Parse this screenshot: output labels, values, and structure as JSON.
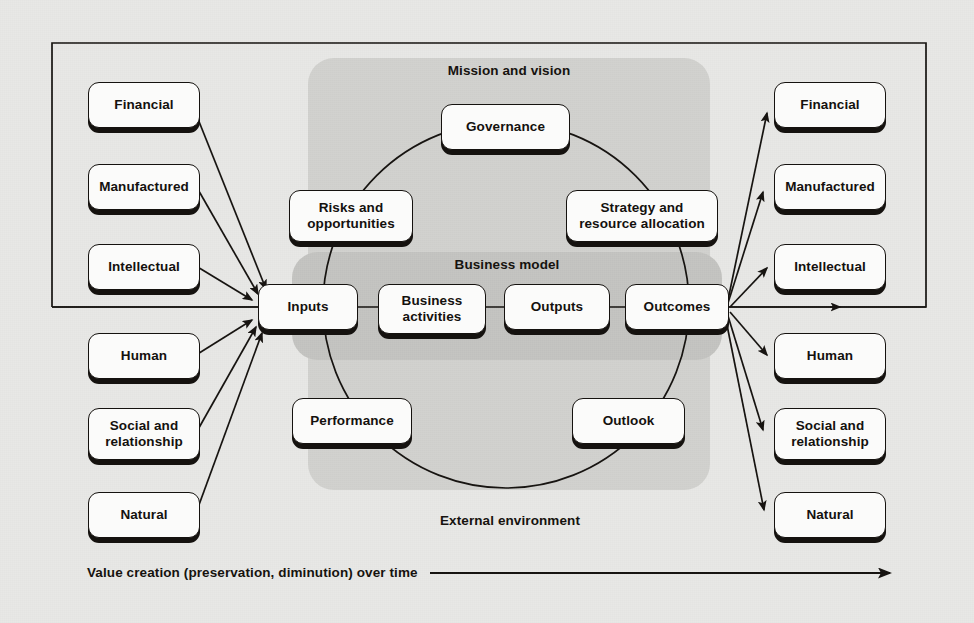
{
  "diagram": {
    "frame": {
      "label": "outer-frame"
    },
    "zones": [
      {
        "id": "mission-and-vision",
        "label": "Mission and vision"
      },
      {
        "id": "business-model",
        "label": "Business model"
      },
      {
        "id": "external-environment",
        "label": "External environment"
      }
    ],
    "capitals_inputs": [
      {
        "id": "financial",
        "label": "Financial"
      },
      {
        "id": "manufactured",
        "label": "Manufactured"
      },
      {
        "id": "intellectual",
        "label": "Intellectual"
      },
      {
        "id": "human",
        "label": "Human"
      },
      {
        "id": "social",
        "label": "Social and\nrelationship"
      },
      {
        "id": "natural",
        "label": "Natural"
      }
    ],
    "capitals_outputs": [
      {
        "id": "financial-out",
        "label": "Financial"
      },
      {
        "id": "manufactured-out",
        "label": "Manufactured"
      },
      {
        "id": "intellectual-out",
        "label": "Intellectual"
      },
      {
        "id": "human-out",
        "label": "Human"
      },
      {
        "id": "social-out",
        "label": "Social and\nrelationship"
      },
      {
        "id": "natural-out",
        "label": "Natural"
      }
    ],
    "cycle_nodes": [
      {
        "id": "governance",
        "label": "Governance"
      },
      {
        "id": "risks",
        "label": "Risks and\nopportunities"
      },
      {
        "id": "strategy",
        "label": "Strategy and\nresource allocation"
      },
      {
        "id": "performance",
        "label": "Performance"
      },
      {
        "id": "outlook",
        "label": "Outlook"
      }
    ],
    "business_model_nodes": [
      {
        "id": "inputs",
        "label": "Inputs"
      },
      {
        "id": "business-activities",
        "label": "Business\nactivities"
      },
      {
        "id": "outputs",
        "label": "Outputs"
      },
      {
        "id": "outcomes",
        "label": "Outcomes"
      }
    ],
    "timeline": {
      "label": "Value creation (preservation, diminution) over time"
    },
    "colors": {
      "page_background": "#e8e8e6",
      "zone_outer_gray": "#d2d2cf",
      "zone_inner_gray": "#c4c4c1",
      "node_fill": "#fbfbfa",
      "ink": "#15120f"
    }
  }
}
